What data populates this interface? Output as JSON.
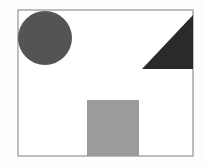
{
  "diagram": {
    "background": "#fdfdfd",
    "frame": {
      "x": 18,
      "y": 10,
      "width": 175,
      "height": 146,
      "stroke": "#a8a8a8",
      "stroke_width": 1.5,
      "fill": "#ffffff"
    },
    "shapes": [
      {
        "type": "circle",
        "name": "circle",
        "cx": 45,
        "cy": 38,
        "r": 27,
        "fill": "#545454"
      },
      {
        "type": "triangle",
        "name": "right-triangle",
        "points": "142,69 193,69 193,15",
        "fill": "#2a2a2a"
      },
      {
        "type": "square",
        "name": "square",
        "x": 87,
        "y": 100,
        "width": 52,
        "height": 56,
        "fill": "#9b9b9b"
      }
    ]
  }
}
